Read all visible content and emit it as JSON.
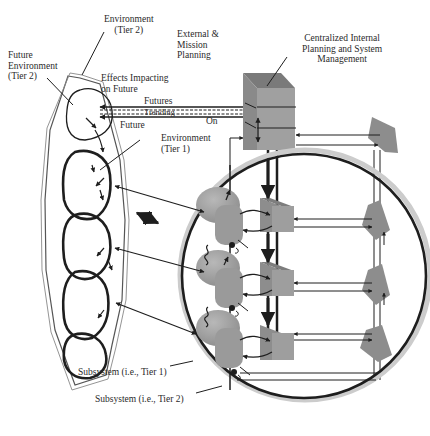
{
  "labels": {
    "environment_tier2": "Environment\n(Tier 2)",
    "external_mission_planning": "External &\nMission\nPlanning",
    "centralized_planning": "Centralized Internal\nPlanning and System\nManagement",
    "future_environment_tier2": "Future\nEnvironment\n(Tier 2)",
    "effects_impacting_future": "Effects Impacting\non Future",
    "futures": "Futures",
    "trending": "Trending",
    "on": "On",
    "future": "Future",
    "environment_tier1": "Environment\n(Tier 1)",
    "subsystem_tier1": "Subsystem (i.e., Tier 1)",
    "subsystem_tier2": "Subsystem (i.e., Tier 2)"
  },
  "colors": {
    "line": "#1e1e1e",
    "shape_fill": "#9a9a9a",
    "shape_dark": "#7d7d7d",
    "shape_light": "#b3b3b3",
    "background": "#ffffff"
  }
}
